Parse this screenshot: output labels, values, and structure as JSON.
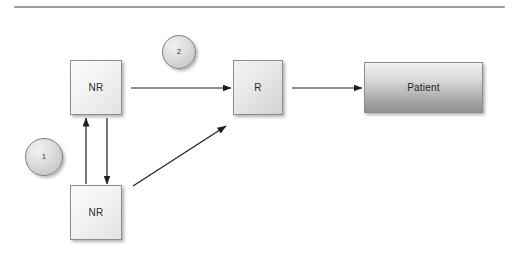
{
  "diagram": {
    "background_color": "#ffffff",
    "rule_color": "#9a9a9a",
    "nodes": [
      {
        "id": "nr-top",
        "label": "NR",
        "shape": "rectangle",
        "fill": "light"
      },
      {
        "id": "nr-bottom",
        "label": "NR",
        "shape": "rectangle",
        "fill": "light"
      },
      {
        "id": "r",
        "label": "R",
        "shape": "rectangle",
        "fill": "light"
      },
      {
        "id": "patient",
        "label": "Patient",
        "shape": "rectangle",
        "fill": "dark-gradient"
      }
    ],
    "markers": [
      {
        "id": "marker-1",
        "label": "1",
        "shape": "circle"
      },
      {
        "id": "marker-2",
        "label": "2",
        "shape": "circle"
      }
    ],
    "arrows": [
      {
        "id": "nr-top-to-r",
        "from": "nr-top",
        "to": "r",
        "direction": "right"
      },
      {
        "id": "r-to-patient",
        "from": "r",
        "to": "patient",
        "direction": "right"
      },
      {
        "id": "nr-bottom-to-nr-top",
        "from": "nr-bottom",
        "to": "nr-top",
        "direction": "up"
      },
      {
        "id": "nr-top-to-nr-bottom",
        "from": "nr-top",
        "to": "nr-bottom",
        "direction": "down"
      },
      {
        "id": "nr-bottom-to-r",
        "from": "nr-bottom",
        "to": "r",
        "direction": "diagonal-up-right"
      }
    ]
  }
}
